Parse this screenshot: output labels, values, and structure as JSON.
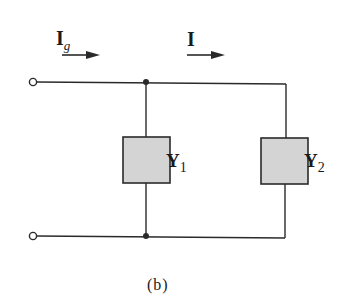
{
  "diagram": {
    "type": "parallel admittance circuit",
    "caption": "(b)",
    "labels": {
      "source_current": "I",
      "source_current_sub": "g",
      "branch_current": "I",
      "admittance_1": "Y",
      "admittance_1_sub": "1",
      "admittance_2": "Y",
      "admittance_2_sub": "2"
    },
    "colors": {
      "wire": "#2a2a2a",
      "box_fill": "#d4d4d4",
      "box_stroke": "#2a2a2a"
    }
  }
}
